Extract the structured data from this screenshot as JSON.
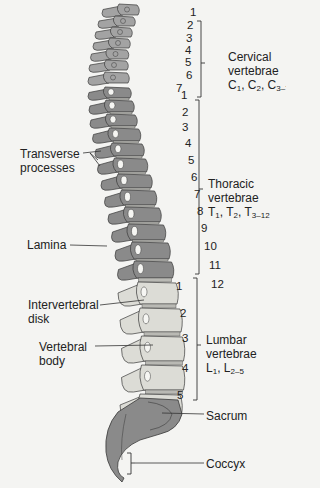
{
  "diagram": {
    "colors": {
      "bone_dark": "#8a8a8a",
      "bone_mid": "#a3a3a3",
      "bone_light": "#dcdcd6",
      "disk": "#b9b9b4",
      "outline": "#3a3a3a",
      "line": "#333333",
      "background": "#f4f4f2"
    },
    "regions": [
      {
        "id": "cervical",
        "name_line1": "Cervical",
        "name_line2": "vertebrae",
        "abbr": [
          {
            "b": "C",
            "s": "1"
          },
          {
            "b": "C",
            "s": "2"
          },
          {
            "b": "C",
            "s": "3–7"
          }
        ],
        "numbers": [
          "1",
          "2",
          "3",
          "4",
          "5",
          "6",
          "7"
        ]
      },
      {
        "id": "thoracic",
        "name_line1": "Thoracic",
        "name_line2": "vertebrae",
        "abbr": [
          {
            "b": "T",
            "s": "1"
          },
          {
            "b": "T",
            "s": "2"
          },
          {
            "b": "T",
            "s": "3–12"
          }
        ],
        "numbers": [
          "1",
          "2",
          "3",
          "4",
          "5",
          "6",
          "7",
          "8",
          "9",
          "10",
          "11",
          "12"
        ]
      },
      {
        "id": "lumbar",
        "name_line1": "Lumbar",
        "name_line2": "vertebrae",
        "abbr": [
          {
            "b": "L",
            "s": "1"
          },
          {
            "b": "L",
            "s": "2–5"
          }
        ],
        "numbers": [
          "1",
          "2",
          "3",
          "4",
          "5"
        ]
      }
    ],
    "left_labels": {
      "transverse_line1": "Transverse",
      "transverse_line2": "processes",
      "lamina": "Lamina",
      "disk_line1": "Intervertebral",
      "disk_line2": "disk",
      "body_line1": "Vertebral",
      "body_line2": "body"
    },
    "right_labels": {
      "sacrum": "Sacrum",
      "coccyx": "Coccyx"
    }
  }
}
